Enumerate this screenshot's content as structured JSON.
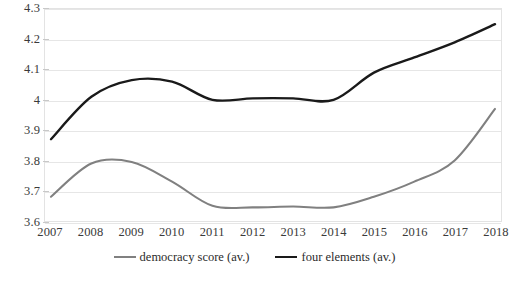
{
  "chart_data": {
    "type": "line",
    "title": "",
    "subtitle": "",
    "xlabel": "",
    "ylabel": "",
    "categories": [
      2007,
      2008,
      2009,
      2010,
      2011,
      2012,
      2013,
      2014,
      2015,
      2016,
      2017,
      2018
    ],
    "x_tick_labels": [
      "2007",
      "2008",
      "2009",
      "2010",
      "2011",
      "2012",
      "2013",
      "2014",
      "2015",
      "2016",
      "2017",
      "2018"
    ],
    "y_tick_labels": [
      "4.3",
      "4.2",
      "4.1",
      "4",
      "3.9",
      "3.8",
      "3.7",
      "3.6"
    ],
    "y_tick_values": [
      4.3,
      4.2,
      4.1,
      4.0,
      3.9,
      3.8,
      3.7,
      3.6
    ],
    "ylim": [
      3.6,
      4.3
    ],
    "grid": true,
    "grid_axis": "y",
    "legend_position": "bottom",
    "smoothed": true,
    "series": [
      {
        "name": "democracy score (av.)",
        "color": "#808080",
        "line_width": 2.1,
        "values": [
          3.68,
          3.79,
          3.795,
          3.73,
          3.65,
          3.645,
          3.648,
          3.645,
          3.68,
          3.73,
          3.8,
          3.97
        ]
      },
      {
        "name": "four elements (av.)",
        "color": "#1a1a1a",
        "line_width": 2.4,
        "values": [
          3.87,
          4.01,
          4.065,
          4.06,
          4.0,
          4.005,
          4.005,
          4.0,
          4.09,
          4.14,
          4.19,
          4.25
        ]
      }
    ]
  },
  "legend": {
    "entries": [
      {
        "label": "democracy score (av.)",
        "color": "#808080"
      },
      {
        "label": "four elements (av.)",
        "color": "#1a1a1a"
      }
    ]
  },
  "colors": {
    "gridline": "#e6e6e6",
    "frame": "#e3e3e3",
    "background": "#ffffff",
    "tick_text": "#3a3a3a"
  }
}
